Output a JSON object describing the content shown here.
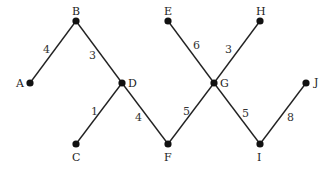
{
  "graph": {
    "nodes": [
      {
        "id": "A",
        "x": 30,
        "y": 83,
        "lx": 16,
        "ly": 78
      },
      {
        "id": "B",
        "x": 76,
        "y": 21,
        "lx": 72,
        "ly": 6
      },
      {
        "id": "C",
        "x": 76,
        "y": 144,
        "lx": 72,
        "ly": 152
      },
      {
        "id": "D",
        "x": 122,
        "y": 83,
        "lx": 128,
        "ly": 78
      },
      {
        "id": "E",
        "x": 168,
        "y": 21,
        "lx": 164,
        "ly": 6
      },
      {
        "id": "F",
        "x": 168,
        "y": 144,
        "lx": 164,
        "ly": 152
      },
      {
        "id": "G",
        "x": 214,
        "y": 83,
        "lx": 220,
        "ly": 78
      },
      {
        "id": "H",
        "x": 260,
        "y": 21,
        "lx": 256,
        "ly": 6
      },
      {
        "id": "I",
        "x": 260,
        "y": 144,
        "lx": 257,
        "ly": 152
      },
      {
        "id": "J",
        "x": 306,
        "y": 83,
        "lx": 314,
        "ly": 77
      }
    ],
    "edges": [
      {
        "from": "A",
        "to": "B",
        "weight": "4",
        "wx": 43,
        "wy": 44
      },
      {
        "from": "B",
        "to": "D",
        "weight": "3",
        "wx": 89,
        "wy": 50
      },
      {
        "from": "D",
        "to": "C",
        "weight": "1",
        "wx": 91,
        "wy": 106
      },
      {
        "from": "D",
        "to": "F",
        "weight": "4",
        "wx": 135,
        "wy": 112
      },
      {
        "from": "E",
        "to": "G",
        "weight": "6",
        "wx": 193,
        "wy": 40
      },
      {
        "from": "G",
        "to": "H",
        "weight": "3",
        "wx": 225,
        "wy": 44
      },
      {
        "from": "F",
        "to": "G",
        "weight": "5",
        "wx": 183,
        "wy": 106
      },
      {
        "from": "G",
        "to": "I",
        "weight": "5",
        "wx": 242,
        "wy": 108
      },
      {
        "from": "I",
        "to": "J",
        "weight": "8",
        "wx": 287,
        "wy": 112
      }
    ]
  }
}
